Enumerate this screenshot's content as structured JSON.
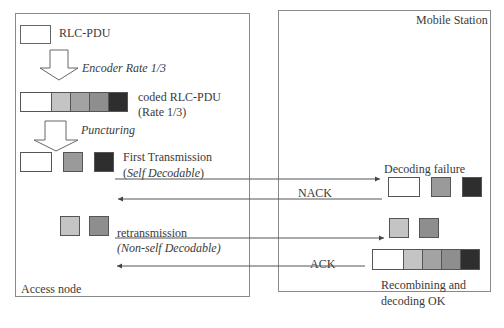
{
  "nodes": {
    "access_node": {
      "label": "Access node"
    },
    "mobile_station": {
      "label": "Mobile Station"
    }
  },
  "colors": {
    "white": "#ffffff",
    "light_gray": "#c4c4c4",
    "mid_gray": "#a3a3a3",
    "gray": "#8e8e8e",
    "dark": "#2e2e2e",
    "border": "#8a8a8a",
    "arrow": "#555555"
  },
  "access_side": {
    "rlc_pdu_label": "RLC-PDU",
    "encoder_label": "Encoder Rate 1/3",
    "coded_label_line1": "coded RLC-PDU",
    "coded_label_line2": "(Rate 1/3)",
    "puncturing_label": "Puncturing",
    "first_tx_line1": "First Transmission",
    "first_tx_line2_prefix": "(",
    "first_tx_line2_italic": "Self Decodable",
    "first_tx_line2_suffix": ")",
    "retx_line1": "retransmission",
    "retx_line2": "(Non-self Decodable)"
  },
  "messages": [
    {
      "direction": "to-mobile",
      "label": ""
    },
    {
      "direction": "to-access",
      "label": "NACK"
    },
    {
      "direction": "to-mobile",
      "label": ""
    },
    {
      "direction": "to-access",
      "label": "ACK"
    }
  ],
  "mobile_side": {
    "decoding_failure_label": "Decoding failure",
    "recombining_line1": "Recombining and",
    "recombining_line2": "decoding OK"
  }
}
